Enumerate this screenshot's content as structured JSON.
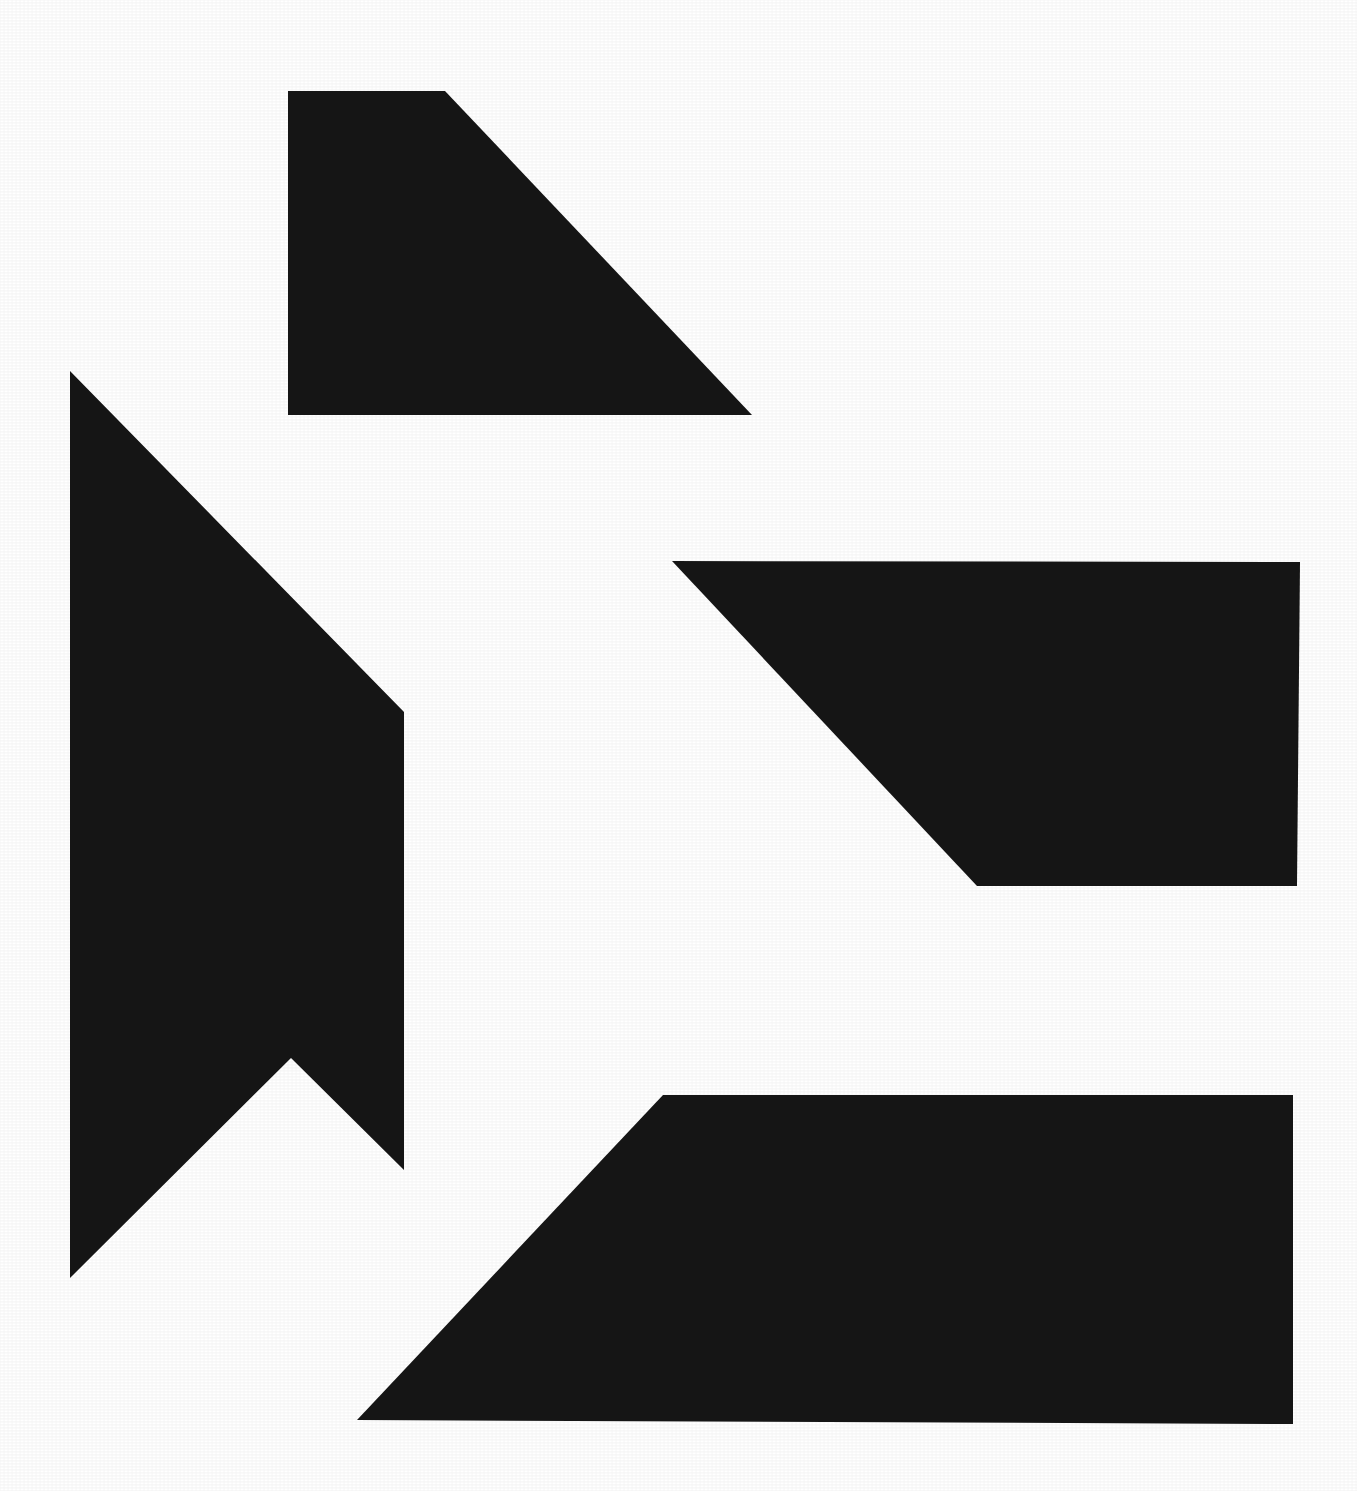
{
  "artwork": {
    "title": "Abstract Geometric Composition",
    "medium_note": "High-contrast black shapes on white ground",
    "canvas": {
      "width": 1357,
      "height": 1491
    },
    "background_color": "#ffffff",
    "ink_color": "#151515"
  },
  "shapes": [
    {
      "id": "shape-top-wedge",
      "name": "top-right-sloped-quadrilateral",
      "description": "Upper block with a long diagonal descending to the right, terminating in a sharp point",
      "fill": "#151515",
      "points": "288,91 445,91 752,415 288,415"
    },
    {
      "id": "shape-left-banner",
      "name": "left-notched-banner",
      "description": "Tall left form: a long diagonal from a top apex down to a vertical edge, with a V notch cut into its lower end",
      "fill": "#151515",
      "points": "70,371 404,712 404,1170 291,1058 70,1278"
    },
    {
      "id": "shape-middle-bar",
      "name": "middle-right-sloped-bar",
      "description": "Horizontal bar at mid-right with its left end cut by a steep downward diagonal",
      "fill": "#151515",
      "points": "672,561 1300,562 1297,886 977,886"
    },
    {
      "id": "shape-bottom-bar",
      "name": "bottom-right-sloped-bar",
      "description": "Lower horizontal bar with its left end cut by a diagonal sloping down to the left",
      "fill": "#151515",
      "points": "663,1095 1293,1095 1293,1424 357,1420"
    }
  ]
}
